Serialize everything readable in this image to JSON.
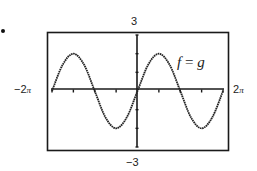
{
  "chart_data": {
    "type": "line",
    "title": "",
    "function": "2 sin(x)",
    "annotation": "f = g",
    "xlabel": "",
    "ylabel": "",
    "xlim": [
      -6.283,
      6.283
    ],
    "ylim": [
      -3,
      3
    ],
    "xlim_labels": [
      "-2π",
      "2π"
    ],
    "ylim_labels": [
      "-3",
      "3"
    ],
    "x_tick_step": "π/2",
    "y_tick_step": 1,
    "grid": false,
    "legend": null,
    "series": [
      {
        "name": "f = g",
        "x": [
          -6.283,
          -5.498,
          -4.712,
          -3.927,
          -3.142,
          -2.356,
          -1.571,
          -0.785,
          0,
          0.785,
          1.571,
          2.356,
          3.142,
          3.927,
          4.712,
          5.498,
          6.283
        ],
        "values": [
          0,
          1.41,
          2,
          1.41,
          0,
          -1.41,
          -2,
          -1.41,
          0,
          1.41,
          2,
          1.41,
          0,
          -1.41,
          -2,
          -1.41,
          0
        ]
      }
    ]
  },
  "labels": {
    "y_max": "3",
    "y_min": "−3",
    "x_min_num": "−2",
    "x_max_num": "2",
    "pi": "π",
    "curve_f": "f",
    "curve_eq": " = ",
    "curve_g": "g"
  },
  "colors": {
    "ink": "#222222",
    "frame": "#1a1a1a",
    "background": "#ffffff"
  }
}
